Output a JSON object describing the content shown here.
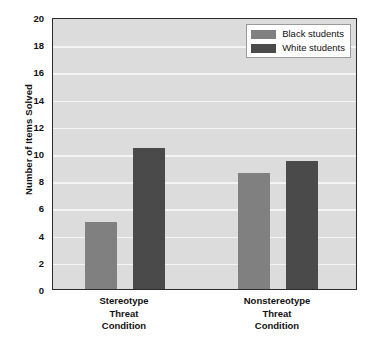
{
  "chart_data": {
    "type": "bar",
    "title": "",
    "subtitle": "",
    "xlabel": "",
    "ylabel": "Number of Items Solved",
    "ylim": [
      0,
      20
    ],
    "ytick_step": 2,
    "yticks": [
      0,
      2,
      4,
      6,
      8,
      10,
      12,
      14,
      16,
      18,
      20
    ],
    "ytick_labels": [
      "0",
      "2",
      "4",
      "6",
      "8",
      "10",
      "12",
      "14",
      "16",
      "18",
      "20"
    ],
    "grid": "horizontal",
    "legend_position": "top-right-inside",
    "categories": [
      "Stereotype Threat Condition",
      "Nonstereotype Threat Condition"
    ],
    "category_lines": [
      [
        "Stereotype",
        "Threat",
        "Condition"
      ],
      [
        "Nonstereotype",
        "Threat",
        "Condition"
      ]
    ],
    "series": [
      {
        "name": "Black students",
        "color": "#808080",
        "values": [
          4.9,
          8.55
        ]
      },
      {
        "name": "White students",
        "color": "#4a4a4a",
        "values": [
          10.35,
          9.4
        ]
      }
    ],
    "plot_background": "#dcdcdc",
    "gridline_color": "#f4f4f4",
    "axis_color": "#2b2b2b",
    "legend_background": "#ffffff"
  },
  "legend": {
    "items": [
      {
        "label": "Black students",
        "color": "#808080"
      },
      {
        "label": "White students",
        "color": "#4a4a4a"
      }
    ]
  }
}
